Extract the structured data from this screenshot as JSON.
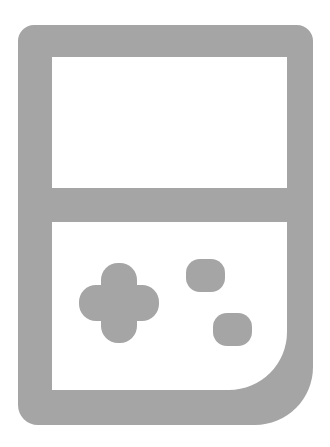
{
  "canvas": {
    "width": 330,
    "height": 447,
    "background_color": "#ffffff"
  },
  "icon": {
    "name": "handheld-game-console-icon",
    "label": "Handheld Game Console",
    "style": "outline",
    "stroke_color": "#a5a5a5",
    "fill_color": "#a5a5a5",
    "stroke_width": 34,
    "parts": [
      {
        "name": "console-body-outline",
        "label": "Console Body",
        "shape": "rounded-rectangle",
        "x": 18,
        "y": 25,
        "width": 295,
        "height": 400,
        "corner_radius_top_left": 16,
        "corner_radius_top_right": 16,
        "corner_radius_bottom_right": 58,
        "corner_radius_bottom_left": 20,
        "color": "#a5a5a5"
      },
      {
        "name": "screen-panel",
        "label": "Screen",
        "shape": "rectangle",
        "x": 52,
        "y": 57,
        "width": 235,
        "height": 131,
        "color": "#ffffff"
      },
      {
        "name": "screen-divider-bar",
        "label": "Divider",
        "shape": "rectangle",
        "x": 18,
        "y": 188,
        "width": 295,
        "height": 34,
        "color": "#a5a5a5"
      },
      {
        "name": "control-panel",
        "label": "Control Panel",
        "shape": "rectangle",
        "x": 52,
        "y": 222,
        "width": 235,
        "height": 168,
        "color": "#ffffff"
      },
      {
        "name": "dpad-control",
        "label": "D-Pad",
        "shape": "rounded-cross",
        "center_x": 119,
        "center_y": 303,
        "span": 80,
        "arm_thickness": 36,
        "corner_radius": 17,
        "color": "#a5a5a5"
      },
      {
        "name": "action-button-top",
        "label": "Action Button A",
        "shape": "rounded-square",
        "x": 186,
        "y": 259,
        "width": 39,
        "height": 33,
        "corner_radius": 14,
        "color": "#a5a5a5"
      },
      {
        "name": "action-button-bottom",
        "label": "Action Button B",
        "shape": "rounded-square",
        "x": 213,
        "y": 313,
        "width": 39,
        "height": 33,
        "corner_radius": 14,
        "color": "#a5a5a5"
      }
    ]
  }
}
